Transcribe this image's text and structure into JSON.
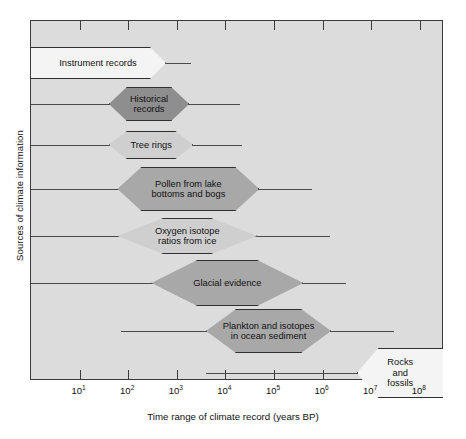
{
  "chart_data": {
    "type": "bar",
    "title": "",
    "xlabel": "Time range of climate record (years BP)",
    "ylabel": "Sources of climate information",
    "x_scale": "log",
    "xlim": [
      1,
      300000000
    ],
    "grid": false,
    "legend": null,
    "tick_labels": [
      "10",
      "10",
      "10",
      "10",
      "10",
      "10",
      "10",
      "10"
    ],
    "tick_exponents": [
      "1",
      "2",
      "3",
      "4",
      "5",
      "6",
      "7",
      "8"
    ],
    "tick_values": [
      10,
      100,
      1000,
      10000,
      100000,
      1000000,
      10000000,
      100000000
    ],
    "categories": [
      "Instrument records",
      "Historical records",
      "Tree rings",
      "Pollen from lake bottoms and bogs",
      "Oxygen isotope ratios from ice",
      "Glacial evidence",
      "Plankton and isotopes in ocean sediment",
      "Rocks and fossils"
    ],
    "series": [
      {
        "name": "Instrument records",
        "label": "Instrument records",
        "line_start": 1,
        "line_end": 2000,
        "box_start": 1,
        "box_end": 600,
        "shade": "white"
      },
      {
        "name": "Historical records",
        "label": "Historical\nrecords",
        "line_start": 1,
        "line_end": 20000,
        "box_start": 40,
        "box_end": 1800,
        "shade": "dark"
      },
      {
        "name": "Tree rings",
        "label": "Tree rings",
        "line_start": 1,
        "line_end": 22000,
        "box_start": 40,
        "box_end": 2200,
        "shade": "light"
      },
      {
        "name": "Pollen from lake bottoms and bogs",
        "label": "Pollen from lake\nbottoms and bogs",
        "line_start": 1,
        "line_end": 600000,
        "box_start": 60,
        "box_end": 50000,
        "shade": "mid"
      },
      {
        "name": "Oxygen isotope ratios from ice",
        "label": "Oxygen isotope\nratios from ice",
        "line_start": 1,
        "line_end": 1400000,
        "box_start": 60,
        "box_end": 45000,
        "shade": "light"
      },
      {
        "name": "Glacial evidence",
        "label": "Glacial evidence",
        "line_start": 1,
        "line_end": 3000000,
        "box_start": 300,
        "box_end": 400000,
        "shade": "mid"
      },
      {
        "name": "Plankton and isotopes in ocean sediment",
        "label": "Plankton and isotopes\nin ocean sediment",
        "line_start": 70,
        "line_end": 30000000,
        "box_start": 4000,
        "box_end": 1500000,
        "shade": "mid"
      },
      {
        "name": "Rocks and fossils",
        "label": "Rocks\nand\nfossils",
        "line_start": 4000,
        "line_end": 5000000,
        "box_start": 5000000,
        "box_end": 300000000,
        "shade": "white"
      }
    ]
  },
  "axis": {
    "y_title": "Sources of climate information",
    "x_title": "Time range of climate record (years BP)"
  },
  "labels": {
    "instrument_records": "Instrument records",
    "historical_records": "Historical\nrecords",
    "tree_rings": "Tree rings",
    "pollen": "Pollen from lake\nbottoms and bogs",
    "oxygen_isotope": "Oxygen isotope\nratios from ice",
    "glacial_evidence": "Glacial evidence",
    "plankton": "Plankton and isotopes\nin ocean sediment",
    "rocks_fossils": "Rocks\nand\nfossils"
  },
  "colors": {
    "plot_background": "#dcdcdc",
    "frame": "#3a3a3a",
    "dark": "#8e8e8e",
    "mid": "#a8a8a8",
    "light": "#cfcfcf",
    "white": "#f4f4f4",
    "line": "#4a4a4a",
    "text": "#111111"
  }
}
